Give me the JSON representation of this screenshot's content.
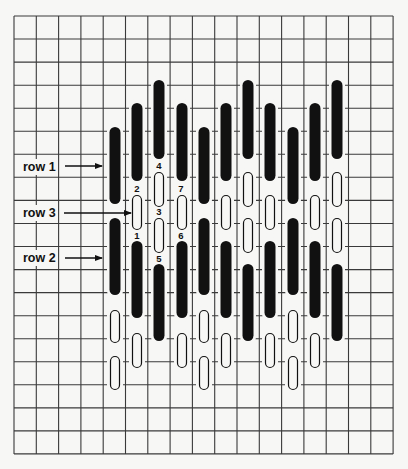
{
  "grid": {
    "left": 14,
    "top": 16,
    "cols": 17,
    "rows": 19,
    "cell_w": 22.3,
    "cell_h": 23.05,
    "line_color": "#3a3a3a",
    "background": "#f7f7f5"
  },
  "colors": {
    "stitch_fill": "#111111",
    "stitch_outline": "#111111",
    "open_fill": "#f7f7f5"
  },
  "labels": [
    {
      "text": "row 1",
      "x": 21,
      "y": 159,
      "arrow_from": 65,
      "arrow_to": 102,
      "arrow_y": 166
    },
    {
      "text": "row 3",
      "x": 21,
      "y": 205,
      "arrow_from": 64,
      "arrow_to": 131,
      "arrow_y": 213
    },
    {
      "text": "row 2",
      "x": 21,
      "y": 250,
      "arrow_from": 65,
      "arrow_to": 102,
      "arrow_y": 258
    }
  ],
  "sequence_numbers": [
    {
      "text": "4",
      "x": 159,
      "y": 166
    },
    {
      "text": "2",
      "x": 137,
      "y": 189
    },
    {
      "text": "7",
      "x": 181,
      "y": 189
    },
    {
      "text": "3",
      "x": 159,
      "y": 212
    },
    {
      "text": "1",
      "x": 137,
      "y": 236
    },
    {
      "text": "6",
      "x": 181,
      "y": 236
    },
    {
      "text": "5",
      "x": 159,
      "y": 259
    }
  ],
  "stitch_columns": [
    {
      "x": 115,
      "stitches": [
        {
          "type": "filled",
          "y1": 127,
          "y2": 204
        },
        {
          "type": "filled",
          "y1": 218,
          "y2": 295
        },
        {
          "type": "open",
          "y1": 310,
          "y2": 343
        },
        {
          "type": "open",
          "y1": 356,
          "y2": 390
        }
      ]
    },
    {
      "x": 137,
      "stitches": [
        {
          "type": "filled",
          "y1": 103,
          "y2": 181
        },
        {
          "type": "open",
          "y1": 195,
          "y2": 230
        },
        {
          "type": "filled",
          "y1": 241,
          "y2": 318
        },
        {
          "type": "open",
          "y1": 333,
          "y2": 368
        }
      ]
    },
    {
      "x": 159,
      "stitches": [
        {
          "type": "filled",
          "y1": 80,
          "y2": 159
        },
        {
          "type": "open",
          "y1": 172,
          "y2": 207
        },
        {
          "type": "open",
          "y1": 218,
          "y2": 253
        },
        {
          "type": "filled",
          "y1": 264,
          "y2": 341
        }
      ]
    },
    {
      "x": 182,
      "stitches": [
        {
          "type": "filled",
          "y1": 103,
          "y2": 181
        },
        {
          "type": "open",
          "y1": 195,
          "y2": 230
        },
        {
          "type": "filled",
          "y1": 241,
          "y2": 318
        },
        {
          "type": "open",
          "y1": 333,
          "y2": 368
        }
      ]
    },
    {
      "x": 204,
      "stitches": [
        {
          "type": "filled",
          "y1": 127,
          "y2": 204
        },
        {
          "type": "filled",
          "y1": 218,
          "y2": 295
        },
        {
          "type": "open",
          "y1": 310,
          "y2": 343
        },
        {
          "type": "open",
          "y1": 356,
          "y2": 390
        }
      ]
    },
    {
      "x": 226,
      "stitches": [
        {
          "type": "filled",
          "y1": 103,
          "y2": 181
        },
        {
          "type": "open",
          "y1": 195,
          "y2": 230
        },
        {
          "type": "filled",
          "y1": 241,
          "y2": 318
        },
        {
          "type": "open",
          "y1": 333,
          "y2": 368
        }
      ]
    },
    {
      "x": 248,
      "stitches": [
        {
          "type": "filled",
          "y1": 80,
          "y2": 159
        },
        {
          "type": "open",
          "y1": 172,
          "y2": 207
        },
        {
          "type": "open",
          "y1": 218,
          "y2": 253
        },
        {
          "type": "filled",
          "y1": 264,
          "y2": 341
        }
      ]
    },
    {
      "x": 270,
      "stitches": [
        {
          "type": "filled",
          "y1": 103,
          "y2": 181
        },
        {
          "type": "open",
          "y1": 195,
          "y2": 230
        },
        {
          "type": "filled",
          "y1": 241,
          "y2": 318
        },
        {
          "type": "open",
          "y1": 333,
          "y2": 368
        }
      ]
    },
    {
      "x": 293,
      "stitches": [
        {
          "type": "filled",
          "y1": 127,
          "y2": 204
        },
        {
          "type": "filled",
          "y1": 218,
          "y2": 295
        },
        {
          "type": "open",
          "y1": 310,
          "y2": 343
        },
        {
          "type": "open",
          "y1": 356,
          "y2": 390
        }
      ]
    },
    {
      "x": 315,
      "stitches": [
        {
          "type": "filled",
          "y1": 103,
          "y2": 181
        },
        {
          "type": "open",
          "y1": 195,
          "y2": 230
        },
        {
          "type": "filled",
          "y1": 241,
          "y2": 318
        },
        {
          "type": "open",
          "y1": 333,
          "y2": 368
        }
      ]
    },
    {
      "x": 337,
      "stitches": [
        {
          "type": "filled",
          "y1": 80,
          "y2": 159
        },
        {
          "type": "open",
          "y1": 172,
          "y2": 207
        },
        {
          "type": "open",
          "y1": 218,
          "y2": 253
        },
        {
          "type": "filled",
          "y1": 264,
          "y2": 341
        }
      ]
    }
  ]
}
